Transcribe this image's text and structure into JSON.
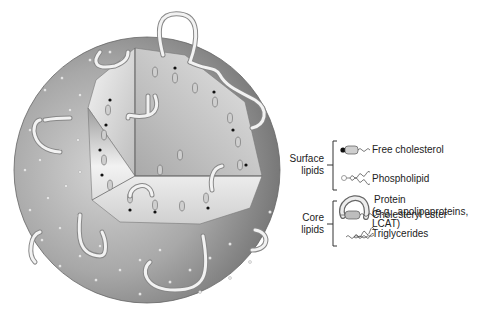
{
  "diagram": {
    "type": "lipoprotein-particle-structure",
    "illustration": {
      "description": "Cutaway sphere showing surface lipid monolayer with embedded proteins and a core of neutral lipids",
      "shell_color": "#8a8a8a",
      "core_color": "#d8d8d8"
    },
    "legend": {
      "groups": [
        {
          "label_line1": "Surface",
          "label_line2": "lipids",
          "items": [
            {
              "icon": "free-cholesterol-icon",
              "label": "Free cholesterol"
            },
            {
              "icon": "phospholipid-icon",
              "label": "Phospholipid"
            }
          ]
        },
        {
          "label_line1": "",
          "label_line2": "",
          "items": [
            {
              "icon": "protein-icon",
              "label_line1": "Protein",
              "label_line2": "(e.g., apolipoproteins,",
              "label_line3": "LCAT)"
            }
          ]
        },
        {
          "label_line1": "Core",
          "label_line2": "lipids",
          "items": [
            {
              "icon": "cholesteryl-ester-icon",
              "label": "Cholesteryl ester"
            },
            {
              "icon": "triglycerides-icon",
              "label": "Triglycerides"
            }
          ]
        }
      ]
    }
  }
}
